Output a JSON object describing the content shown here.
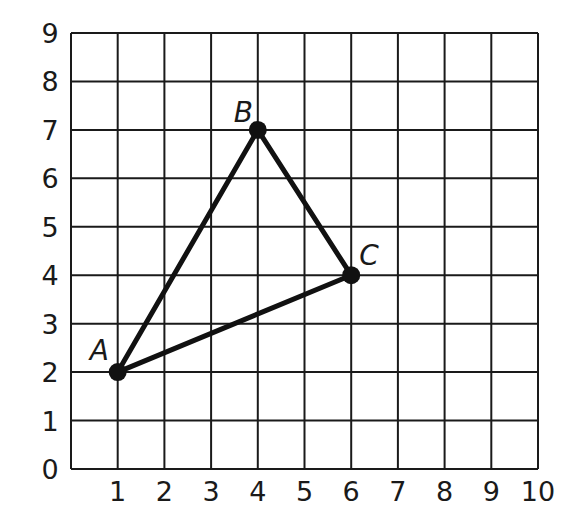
{
  "chart_data": {
    "type": "scatter",
    "title": "",
    "xlabel": "",
    "ylabel": "",
    "xlim": [
      0,
      10
    ],
    "ylim": [
      0,
      9
    ],
    "grid": true,
    "x_ticks": [
      "1",
      "2",
      "3",
      "4",
      "5",
      "6",
      "7",
      "8",
      "9",
      "10"
    ],
    "y_ticks": [
      "0",
      "1",
      "2",
      "3",
      "4",
      "5",
      "6",
      "7",
      "8",
      "9"
    ],
    "points": [
      {
        "label": "A",
        "x": 1,
        "y": 2
      },
      {
        "label": "B",
        "x": 4,
        "y": 7
      },
      {
        "label": "C",
        "x": 6,
        "y": 4
      }
    ],
    "segments": [
      [
        "A",
        "B"
      ],
      [
        "B",
        "C"
      ],
      [
        "C",
        "A"
      ]
    ],
    "shape": "triangle ABC"
  },
  "colors": {
    "grid": "#1a1a1a",
    "shape": "#111111",
    "background": "#ffffff"
  }
}
